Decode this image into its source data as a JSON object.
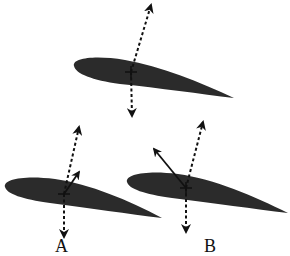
{
  "diagram": {
    "colors": {
      "airfoil_fill": "#2b2b2b",
      "vector_stroke": "#111111",
      "background": "#ffffff"
    },
    "airfoils": [
      {
        "id": "top",
        "label": "",
        "vectors": [
          "dashed-up-lift",
          "dashed-down-weight"
        ]
      },
      {
        "id": "A",
        "label": "A",
        "vectors": [
          "dashed-up-lift",
          "solid-short-up-right",
          "dashed-down-weight"
        ]
      },
      {
        "id": "B",
        "label": "B",
        "vectors": [
          "dashed-up-lift",
          "solid-up-left",
          "dashed-down-weight"
        ]
      }
    ]
  }
}
